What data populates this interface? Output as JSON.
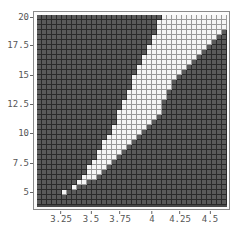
{
  "chart_data": {
    "type": "heatmap",
    "title": "",
    "xlabel": "",
    "ylabel": "",
    "xlim": [
      3.1,
      4.6
    ],
    "ylim": [
      3.5,
      20.3
    ],
    "grid": true,
    "legend": null,
    "x_ticks": [
      {
        "label": "3.25",
        "px": 61
      },
      {
        "label": "3.5",
        "px": 91
      },
      {
        "label": "3.75",
        "px": 120
      },
      {
        "label": "4",
        "px": 152
      },
      {
        "label": "4.25",
        "px": 180
      },
      {
        "label": "4.5",
        "px": 210
      }
    ],
    "y_ticks": [
      {
        "label": "20",
        "px": 17
      },
      {
        "label": "17.5",
        "px": 45
      },
      {
        "label": "15",
        "px": 75
      },
      {
        "label": "12.5",
        "px": 104
      },
      {
        "label": "10",
        "px": 133
      },
      {
        "label": "7.5",
        "px": 163
      },
      {
        "label": "5",
        "px": 192
      }
    ],
    "grid_cols": 38,
    "grid_rows": 38,
    "cell_px": 5,
    "values_description": "Binary region plot: light cells = region true, dark cells = false. Each entry gives [row, firstLightCol, lastLightCol] with row 0 at top (y=20).",
    "light_spans": [
      [
        0,
        25,
        37
      ],
      [
        1,
        24,
        37
      ],
      [
        2,
        24,
        37
      ],
      [
        3,
        24,
        36
      ],
      [
        4,
        23,
        35
      ],
      [
        5,
        23,
        34
      ],
      [
        6,
        22,
        33
      ],
      [
        7,
        22,
        32
      ],
      [
        8,
        21,
        31
      ],
      [
        9,
        21,
        30
      ],
      [
        10,
        20,
        29
      ],
      [
        11,
        20,
        28
      ],
      [
        12,
        19,
        27
      ],
      [
        13,
        19,
        26
      ],
      [
        14,
        19,
        26
      ],
      [
        15,
        18,
        25
      ],
      [
        16,
        18,
        25
      ],
      [
        17,
        17,
        24
      ],
      [
        18,
        17,
        24
      ],
      [
        19,
        16,
        24
      ],
      [
        20,
        16,
        23
      ],
      [
        21,
        16,
        22
      ],
      [
        22,
        15,
        21
      ],
      [
        23,
        15,
        20
      ],
      [
        24,
        14,
        19
      ],
      [
        25,
        13,
        18
      ],
      [
        26,
        13,
        17
      ],
      [
        27,
        12,
        16
      ],
      [
        28,
        12,
        15
      ],
      [
        29,
        11,
        14
      ],
      [
        30,
        10,
        13
      ],
      [
        31,
        10,
        12
      ],
      [
        32,
        9,
        11
      ],
      [
        33,
        8,
        9
      ],
      [
        34,
        7,
        7
      ],
      [
        35,
        5,
        5
      ]
    ],
    "colors": {
      "false_region": "#5a5a5a",
      "true_region": "#f6f6f6",
      "mesh": "#2a2a2a"
    }
  }
}
